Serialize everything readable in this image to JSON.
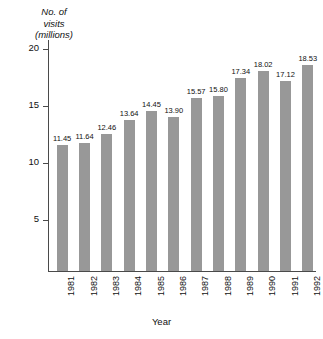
{
  "chart_data": {
    "type": "bar",
    "title": "",
    "ylabel": "No. of\nvisits\n(millions)",
    "xlabel": "Year",
    "categories": [
      "1981",
      "1982",
      "1983",
      "1984",
      "1985",
      "1986",
      "1987",
      "1988",
      "1989",
      "1990",
      "1991",
      "1992"
    ],
    "values": [
      11.45,
      11.64,
      12.46,
      13.64,
      14.45,
      13.9,
      15.57,
      15.8,
      17.34,
      18.02,
      17.12,
      18.53
    ],
    "value_labels": [
      "11.45",
      "11.64",
      "12.46",
      "13.64",
      "14.45",
      "13.90",
      "15.57",
      "15.80",
      "17.34",
      "18.02",
      "17.12",
      "18.53"
    ],
    "yticks": [
      5,
      10,
      15,
      20
    ],
    "ytick_labels": [
      "5",
      "10",
      "15",
      "20"
    ],
    "ylim": [
      0.4,
      20.8
    ],
    "grid": false,
    "legend": false,
    "bar_color": "#989898",
    "axis_color": "#4a4a4a",
    "text_color": "#111111",
    "background": "#ffffff"
  }
}
